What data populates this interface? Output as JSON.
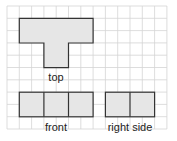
{
  "grid": {
    "origin_x": 7,
    "origin_y": 6,
    "cell": 12.3,
    "cols": 13,
    "rows": 10,
    "line_color": "#d4d4d4",
    "shape_fill": "#e6e6e6",
    "shape_stroke": "#333333"
  },
  "views": [
    {
      "id": "top",
      "label": "top",
      "label_x": 56,
      "label_y": 72
    },
    {
      "id": "front",
      "label": "front",
      "label_x": 56,
      "label_y": 122
    },
    {
      "id": "right-side",
      "label": "right side",
      "label_x": 130,
      "label_y": 122
    }
  ]
}
